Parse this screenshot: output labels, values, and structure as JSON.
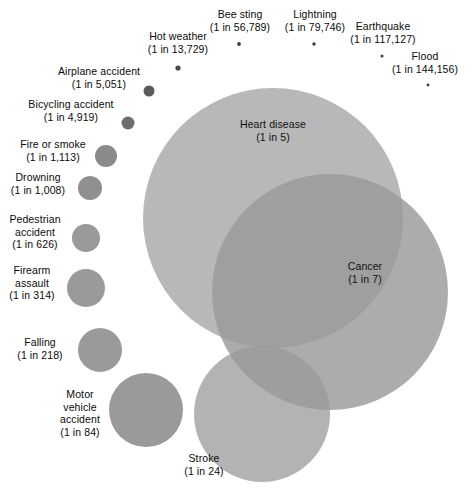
{
  "chart_data": {
    "type": "scatter",
    "title": "",
    "subtitle": "",
    "xlabel": "",
    "ylabel": "",
    "grid": false,
    "legend_position": "none",
    "encoding": "bubble area proportional to lifetime risk (1 divided by odds)",
    "colors": {
      "background": "#ffffff",
      "bubble_large_light": "#b8b8b8",
      "bubble_mid": "#9a9a9a",
      "bubble_dark_small": "#7d7d7d",
      "label_text": "#0b0b0b"
    },
    "categories": [
      "Heart disease",
      "Cancer",
      "Stroke",
      "Motor vehicle accident",
      "Falling",
      "Firearm assault",
      "Pedestrian accident",
      "Drowning",
      "Fire or smoke",
      "Bicycling accident",
      "Airplane accident",
      "Hot weather",
      "Bee sting",
      "Lightning",
      "Earthquake",
      "Flood"
    ],
    "values": [
      5,
      7,
      24,
      84,
      218,
      314,
      626,
      1008,
      1113,
      4919,
      5051,
      13729,
      56789,
      79746,
      117127,
      144156
    ],
    "value_unit": "1 in N lifetime odds of death",
    "points": [
      {
        "name": "Heart disease",
        "odds_text": "(1 in 5)",
        "odds": 5,
        "cx": 273,
        "cy": 218,
        "r": 130,
        "fill": "#b8b8b8",
        "opacity": 1
      },
      {
        "name": "Cancer",
        "odds_text": "(1 in 7)",
        "odds": 7,
        "cx": 330,
        "cy": 292,
        "r": 118,
        "fill": "#9a9a9a",
        "opacity": 0.82
      },
      {
        "name": "Stroke",
        "odds_text": "(1 in 24)",
        "odds": 24,
        "cx": 262,
        "cy": 414,
        "r": 68,
        "fill": "#9a9a9a",
        "opacity": 0.75
      },
      {
        "name": "Motor vehicle accident",
        "odds_text": "(1 in 84)",
        "odds": 84,
        "cx": 146,
        "cy": 410,
        "r": 37,
        "fill": "#9a9a9a",
        "opacity": 1
      },
      {
        "name": "Falling",
        "odds_text": "(1 in 218)",
        "odds": 218,
        "cx": 100,
        "cy": 350,
        "r": 22,
        "fill": "#9a9a9a",
        "opacity": 1
      },
      {
        "name": "Firearm assault",
        "odds_text": "(1 in 314)",
        "odds": 314,
        "cx": 86,
        "cy": 288,
        "r": 19,
        "fill": "#9a9a9a",
        "opacity": 1
      },
      {
        "name": "Pedestrian accident",
        "odds_text": "(1 in 626)",
        "odds": 626,
        "cx": 86,
        "cy": 238,
        "r": 14,
        "fill": "#9a9a9a",
        "opacity": 1
      },
      {
        "name": "Drowning",
        "odds_text": "(1 in 1,008)",
        "odds": 1008,
        "cx": 90,
        "cy": 188,
        "r": 12,
        "fill": "#909090",
        "opacity": 1
      },
      {
        "name": "Fire or smoke",
        "odds_text": "(1 in 1,113)",
        "odds": 1113,
        "cx": 106,
        "cy": 156,
        "r": 11,
        "fill": "#8a8a8a",
        "opacity": 1
      },
      {
        "name": "Bicycling accident",
        "odds_text": "(1 in 4,919)",
        "odds": 4919,
        "cx": 128,
        "cy": 123,
        "r": 6.5,
        "fill": "#6e6e6e",
        "opacity": 1
      },
      {
        "name": "Airplane accident",
        "odds_text": "(1 in 5,051)",
        "odds": 5051,
        "cx": 149,
        "cy": 91,
        "r": 5.5,
        "fill": "#5a5a5a",
        "opacity": 1
      },
      {
        "name": "Hot weather",
        "odds_text": "(1 in 13,729)",
        "odds": 13729,
        "cx": 178,
        "cy": 68,
        "r": 2.6,
        "fill": "#4a4a4a",
        "opacity": 1
      },
      {
        "name": "Bee sting",
        "odds_text": "(1 in 56,789)",
        "odds": 56789,
        "cx": 239,
        "cy": 44,
        "r": 1.9,
        "fill": "#3d3d3d",
        "opacity": 1
      },
      {
        "name": "Lightning",
        "odds_text": "(1 in 79,746)",
        "odds": 79746,
        "cx": 314,
        "cy": 44,
        "r": 1.7,
        "fill": "#3d3d3d",
        "opacity": 1
      },
      {
        "name": "Earthquake",
        "odds_text": "(1 in 117,127)",
        "odds": 117127,
        "cx": 382,
        "cy": 56,
        "r": 1.5,
        "fill": "#3d3d3d",
        "opacity": 1
      },
      {
        "name": "Flood",
        "odds_text": "(1 in 144,156)",
        "odds": 144156,
        "cx": 428,
        "cy": 85,
        "r": 1.4,
        "fill": "#3d3d3d",
        "opacity": 1
      }
    ],
    "labels": [
      {
        "key": "bee_sting",
        "name": "Bee sting",
        "odds_text": "(1 in 56,789)",
        "left": 195,
        "top": 8,
        "width": 90
      },
      {
        "key": "lightning",
        "name": "Lightning",
        "odds_text": "(1 in 79,746)",
        "left": 270,
        "top": 8,
        "width": 90
      },
      {
        "key": "earthquake",
        "name": "Earthquake",
        "odds_text": "(1 in 117,127)",
        "left": 334,
        "top": 20,
        "width": 98
      },
      {
        "key": "flood",
        "name": "Flood",
        "odds_text": "(1 in 144,156)",
        "left": 378,
        "top": 50,
        "width": 94
      },
      {
        "key": "hot_weather",
        "name": "Hot weather",
        "odds_text": "(1 in 13,729)",
        "left": 131,
        "top": 30,
        "width": 94
      },
      {
        "key": "airplane_accident",
        "name": "Airplane accident",
        "odds_text": "(1 in 5,051)",
        "left": 52,
        "top": 65,
        "width": 94
      },
      {
        "key": "bicycling_accident",
        "name": "Bicycling accident",
        "odds_text": "(1 in 4,919)",
        "left": 22,
        "top": 98,
        "width": 98
      },
      {
        "key": "fire_or_smoke",
        "name": "Fire or smoke",
        "odds_text": "(1 in 1,113)",
        "left": 12,
        "top": 138,
        "width": 82
      },
      {
        "key": "drowning",
        "name": "Drowning",
        "odds_text": "(1 in 1,008)",
        "left": 2,
        "top": 171,
        "width": 72
      },
      {
        "key": "pedestrian_accident",
        "name": "Pedestrian accident",
        "odds_text": "(1 in 626)",
        "left": 2,
        "top": 213,
        "width": 66
      },
      {
        "key": "firearm_assault",
        "name": "Firearm assault",
        "odds_text": "(1 in 314)",
        "left": 2,
        "top": 264,
        "width": 60
      },
      {
        "key": "falling",
        "name": "Falling",
        "odds_text": "(1 in 218)",
        "left": 8,
        "top": 336,
        "width": 64
      },
      {
        "key": "motor_vehicle_accident",
        "name": "Motor vehicle accident",
        "odds_text": "(1 in 84)",
        "left": 52,
        "top": 388,
        "width": 56
      },
      {
        "key": "stroke",
        "name": "Stroke",
        "odds_text": "(1 in 24)",
        "left": 170,
        "top": 452,
        "width": 68
      },
      {
        "key": "heart_disease",
        "name": "Heart disease",
        "odds_text": "(1 in 5)",
        "left": 223,
        "top": 118,
        "width": 100
      },
      {
        "key": "cancer",
        "name": "Cancer",
        "odds_text": "(1 in 7)",
        "left": 333,
        "top": 260,
        "width": 64
      }
    ],
    "multiline_labels": {
      "pedestrian_accident": [
        "Pedestrian",
        "accident",
        "(1 in 626)"
      ],
      "firearm_assault": [
        "Firearm",
        "assault",
        "(1 in 314)"
      ],
      "motor_vehicle_accident": [
        "Motor",
        "vehicle",
        "accident",
        "(1 in 84)"
      ]
    }
  }
}
